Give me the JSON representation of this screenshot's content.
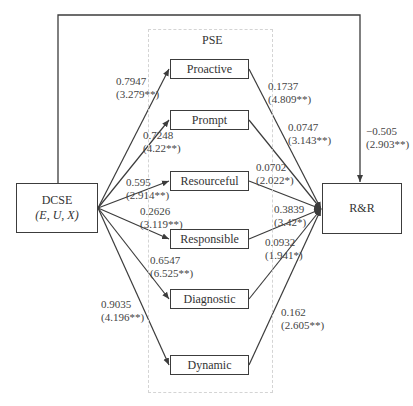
{
  "diagram": {
    "group_label": "PSE",
    "source": {
      "line1": "DCSE",
      "line2": "(E, U, X)"
    },
    "target": {
      "label": "R&R"
    },
    "mediators": [
      {
        "label": "Proactive"
      },
      {
        "label": "Prompt"
      },
      {
        "label": "Resourceful"
      },
      {
        "label": "Responsible"
      },
      {
        "label": "Diagnostic"
      },
      {
        "label": "Dynamic"
      }
    ],
    "paths_a": [
      {
        "coef": "0.7947",
        "t": "(3.279**)"
      },
      {
        "coef": "0.7248",
        "t": "(4.22**)"
      },
      {
        "coef": "0.595",
        "t": "(2.914**)"
      },
      {
        "coef": "0.2626",
        "t": "(3.119**)"
      },
      {
        "coef": "0.6547",
        "t": "(6.525**)"
      },
      {
        "coef": "0.9035",
        "t": "(4.196**)"
      }
    ],
    "paths_b": [
      {
        "coef": "0.1737",
        "t": "(4.809**)"
      },
      {
        "coef": "0.0747",
        "t": "(3.143**)"
      },
      {
        "coef": "0.0702",
        "t": "(2.022*)"
      },
      {
        "coef": "0.3839",
        "t": "(3.42*)"
      },
      {
        "coef": "0.0932",
        "t": "(1.941*)"
      },
      {
        "coef": "0.162",
        "t": "(2.605**)"
      }
    ],
    "direct_path": {
      "coef": "−0.505",
      "t": "(2.903**)"
    }
  },
  "colors": {
    "line": "#3c3c3c",
    "dashed_group": "#d4d4d4",
    "text": "#333333"
  }
}
